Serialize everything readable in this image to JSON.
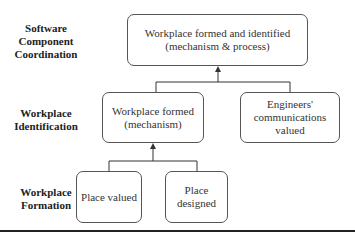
{
  "levels": [
    {
      "id": "software-component-coordination",
      "label_lines": [
        "Software",
        "Component",
        "Coordination"
      ]
    },
    {
      "id": "workplace-identification",
      "label_lines": [
        "Workplace",
        "Identification"
      ]
    },
    {
      "id": "workplace-formation",
      "label_lines": [
        "Workplace",
        "Formation"
      ]
    }
  ],
  "nodes": {
    "top": {
      "lines": [
        "Workplace formed and identified",
        "(mechanism & process)"
      ]
    },
    "mid_left": {
      "lines": [
        "Workplace formed",
        "(mechanism)"
      ]
    },
    "mid_right": {
      "lines": [
        "Engineers'",
        "communications",
        "valued"
      ]
    },
    "bottom_left": {
      "lines": [
        "Place valued"
      ]
    },
    "bottom_right": {
      "lines": [
        "Place",
        "designed"
      ]
    }
  },
  "edges": [
    {
      "from": [
        "mid_left",
        "mid_right"
      ],
      "to": "top",
      "style": "arrow"
    },
    {
      "from": [
        "bottom_left",
        "bottom_right"
      ],
      "to": "mid_left",
      "style": "arrow"
    }
  ],
  "colors": {
    "line": "#333333",
    "border": "#555555",
    "text": "#222222"
  }
}
